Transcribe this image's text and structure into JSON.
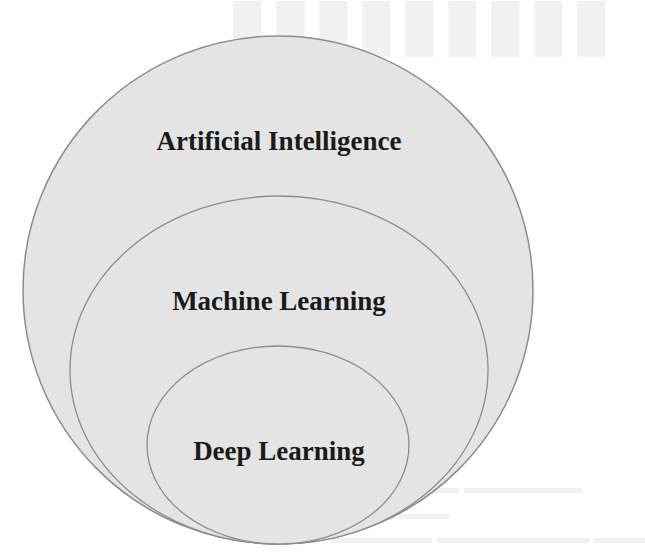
{
  "diagram": {
    "type": "nested-venn",
    "colors": {
      "fill": "#e4e4e4",
      "stroke": "#8c8c8c",
      "text": "#1a1a1a",
      "background": "#ffffff"
    },
    "sets": [
      {
        "id": "artificial-intelligence",
        "label": "Artificial Intelligence",
        "shape": {
          "cx": 278,
          "cy": 290,
          "rx": 255,
          "ry": 254
        }
      },
      {
        "id": "machine-learning",
        "label": "Machine Learning",
        "parent": "artificial-intelligence",
        "shape": {
          "cx": 279,
          "cy": 370,
          "rx": 209,
          "ry": 174
        }
      },
      {
        "id": "deep-learning",
        "label": "Deep Learning",
        "parent": "machine-learning",
        "shape": {
          "cx": 278,
          "cy": 445,
          "rx": 131,
          "ry": 99
        }
      }
    ]
  }
}
